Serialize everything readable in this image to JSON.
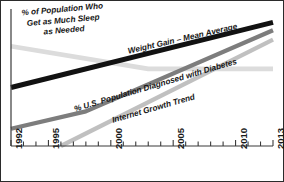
{
  "chart_data": {
    "type": "line",
    "title": "",
    "xlabel": "",
    "ylabel": "",
    "xlim": [
      1992,
      2013
    ],
    "ylim": [
      0,
      100
    ],
    "grid": false,
    "legend": "inline-annotations",
    "x_tick_labels": [
      "1992",
      "1995",
      "2000",
      "2005",
      "2010",
      "2013"
    ],
    "x_tick_values": [
      1992,
      1995,
      2000,
      2005,
      2010,
      2013
    ],
    "x_minor_ticks": [
      1992,
      1993,
      1994,
      1995,
      1996,
      1997,
      1998,
      1999,
      2000,
      2001,
      2002,
      2003,
      2004,
      2005,
      2006,
      2007,
      2008,
      2009,
      2010,
      2011,
      2012,
      2013
    ],
    "y_tick_labels": [],
    "series": [
      {
        "name": "Weight Gain – Mean Average",
        "color": "#121212",
        "width": 5.0,
        "x": [
          1992,
          2013
        ],
        "values": [
          44,
          93
        ]
      },
      {
        "name": "% U.S. Population Diagnosed with Diabetes",
        "color": "#7d7d7d",
        "width": 4.2,
        "x": [
          1992,
          1998,
          2013
        ],
        "values": [
          13,
          26,
          87
        ]
      },
      {
        "name": "Internet Growth Trend",
        "color": "#c0c0c0",
        "width": 4.2,
        "x": [
          1996,
          2013
        ],
        "values": [
          0,
          80
        ]
      },
      {
        "name": "% of Population Who Get as Much Sleep as Needed",
        "color": "#dcdcdc",
        "width": 4.6,
        "x": [
          1992,
          2003,
          2013
        ],
        "values": [
          75,
          58,
          58
        ]
      }
    ],
    "annotations": [
      {
        "id": "sleep-annotation",
        "text_lines": [
          "% of Population Who",
          "Get as Much Sleep",
          "as Needed"
        ],
        "text": "% of Population Who Get as Much Sleep as Needed"
      },
      {
        "id": "weight-annotation",
        "text": "Weight Gain – Mean Average"
      },
      {
        "id": "diabetes-annotation",
        "text": "% U.S. Population Diagnosed with Diabetes"
      },
      {
        "id": "internet-annotation",
        "text": "Internet Growth Trend"
      }
    ]
  },
  "axis": {
    "tick_1992": "1992",
    "tick_1995": "1995",
    "tick_2000": "2000",
    "tick_2005": "2005",
    "tick_2010": "2010",
    "tick_2013": "2013"
  },
  "annotations": {
    "sleep_line1": "% of Population Who",
    "sleep_line2": "Get as Much Sleep",
    "sleep_line3": "as Needed",
    "weight": "Weight Gain – Mean Average",
    "diabetes": "% U.S. Population Diagnosed with Diabetes",
    "internet": "Internet Growth Trend"
  },
  "colors": {
    "border": "#2b2b2b",
    "axis": "#3a3a3a",
    "weight_line": "#121212",
    "diabetes_line": "#7d7d7d",
    "internet_line": "#c0c0c0",
    "sleep_line": "#dcdcdc",
    "background": "#ffffff"
  }
}
